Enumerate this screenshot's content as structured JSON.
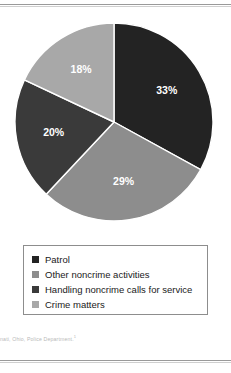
{
  "figure": {
    "footnote": "cinnati, Ohio, Police Department.",
    "footnote_marker": "1"
  },
  "legend": {
    "items": [
      {
        "label": "Patrol",
        "color": "#232323"
      },
      {
        "label": "Other noncrime activities",
        "color": "#8d8d8d"
      },
      {
        "label": "Handling noncrime calls for service",
        "color": "#3a3a3a"
      },
      {
        "label": "Crime matters",
        "color": "#a8a8a8"
      }
    ]
  },
  "chart_data": {
    "type": "pie",
    "title": "",
    "legend_position": "bottom",
    "start_angle_deg": 0,
    "direction": "clockwise",
    "categories": [
      "Patrol",
      "Other noncrime activities",
      "Handling noncrime calls for service",
      "Crime matters"
    ],
    "values": [
      33,
      29,
      20,
      18
    ],
    "labels": [
      "33%",
      "29%",
      "20%",
      "18%"
    ],
    "colors": [
      "#232323",
      "#8d8d8d",
      "#3a3a3a",
      "#a8a8a8"
    ],
    "label_color": "#ffffff",
    "units": "percent"
  }
}
